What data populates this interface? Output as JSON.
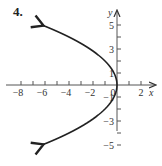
{
  "problem_number": "4.",
  "chart_data": {
    "type": "line",
    "title": "",
    "xlabel": "x",
    "ylabel": "y",
    "xlim": [
      -8,
      2
    ],
    "ylim": [
      -5,
      5
    ],
    "x_tick_labels": [
      "−8",
      "−6",
      "−4",
      "−2",
      "0",
      "2"
    ],
    "x_tick_label_values": [
      -8,
      -6,
      -4,
      -2,
      0,
      2
    ],
    "x_ticks": [
      -8,
      -7,
      -6,
      -5,
      -4,
      -3,
      -2,
      -1,
      1,
      2
    ],
    "y_tick_labels": [
      "5",
      "3",
      "1",
      "−1",
      "−3",
      "−5"
    ],
    "y_tick_label_values": [
      5,
      3,
      1,
      -1,
      -3,
      -5
    ],
    "y_ticks": [
      -5,
      -4,
      -3,
      -2,
      -1,
      1,
      2,
      3,
      4,
      5
    ],
    "series": [
      {
        "name": "x = -y^2/4",
        "equation": "x = -y²/4",
        "y_range": [
          -5,
          5
        ],
        "arrows": "both-ends",
        "points": [
          [
            -6.25,
            5
          ],
          [
            -4,
            4
          ],
          [
            -2.25,
            3
          ],
          [
            -1,
            2
          ],
          [
            -0.25,
            1
          ],
          [
            0,
            0
          ],
          [
            -0.25,
            -1
          ],
          [
            -1,
            -2
          ],
          [
            -2.25,
            -3
          ],
          [
            -4,
            -4
          ],
          [
            -6.25,
            -5
          ]
        ]
      }
    ],
    "grid": false
  }
}
